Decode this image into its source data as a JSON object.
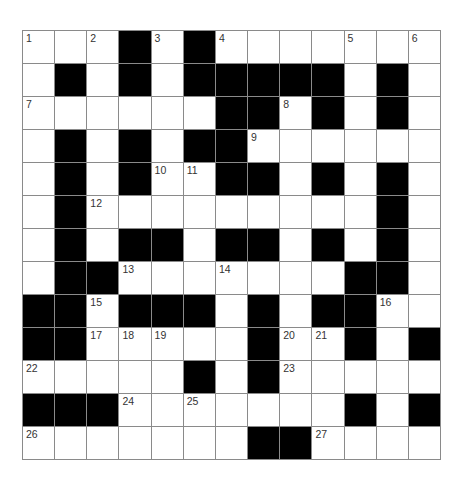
{
  "puzzle": {
    "rows": 13,
    "cols": 13,
    "colors": {
      "block": "#000000",
      "cell": "#ffffff",
      "gridline": "#8a8a8a",
      "number": "#333333"
    },
    "layout": [
      "...#.#.......",
      ".#.#.#####.#.",
      "......##.#.#.",
      ".#.#.##......",
      ".#.#..##.#.#.",
      ".#.........#.",
      ".#.##.##.#.#.",
      ".##.......##.",
      "##.###.#.##..",
      "##.....#..#.#",
      ".....#.#.....",
      "###.......#.#",
      ".......##...."
    ],
    "numbers": [
      {
        "r": 0,
        "c": 0,
        "n": "1"
      },
      {
        "r": 0,
        "c": 2,
        "n": "2"
      },
      {
        "r": 0,
        "c": 4,
        "n": "3"
      },
      {
        "r": 0,
        "c": 6,
        "n": "4"
      },
      {
        "r": 0,
        "c": 10,
        "n": "5"
      },
      {
        "r": 0,
        "c": 12,
        "n": "6"
      },
      {
        "r": 2,
        "c": 0,
        "n": "7"
      },
      {
        "r": 2,
        "c": 8,
        "n": "8"
      },
      {
        "r": 3,
        "c": 7,
        "n": "9"
      },
      {
        "r": 4,
        "c": 4,
        "n": "10"
      },
      {
        "r": 4,
        "c": 5,
        "n": "11"
      },
      {
        "r": 5,
        "c": 2,
        "n": "12"
      },
      {
        "r": 7,
        "c": 3,
        "n": "13"
      },
      {
        "r": 7,
        "c": 6,
        "n": "14"
      },
      {
        "r": 8,
        "c": 2,
        "n": "15"
      },
      {
        "r": 8,
        "c": 11,
        "n": "16"
      },
      {
        "r": 9,
        "c": 2,
        "n": "17"
      },
      {
        "r": 9,
        "c": 3,
        "n": "18"
      },
      {
        "r": 9,
        "c": 4,
        "n": "19"
      },
      {
        "r": 9,
        "c": 8,
        "n": "20"
      },
      {
        "r": 9,
        "c": 9,
        "n": "21"
      },
      {
        "r": 10,
        "c": 0,
        "n": "22"
      },
      {
        "r": 10,
        "c": 8,
        "n": "23"
      },
      {
        "r": 11,
        "c": 3,
        "n": "24"
      },
      {
        "r": 11,
        "c": 5,
        "n": "25"
      },
      {
        "r": 12,
        "c": 0,
        "n": "26"
      },
      {
        "r": 12,
        "c": 9,
        "n": "27"
      }
    ],
    "entries": {}
  }
}
